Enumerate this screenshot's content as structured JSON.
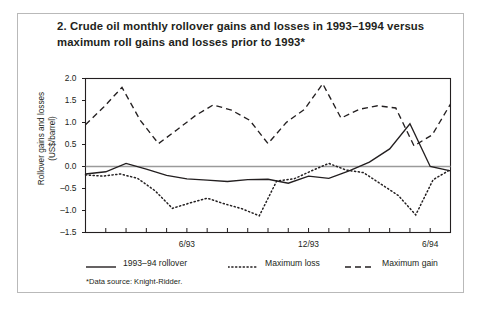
{
  "figure": {
    "title": "2. Crude oil monthly rollover gains and losses in 1993–1994 versus maximum roll gains and losses prior to 1993*",
    "footnote": "*Data source: Knight-Ridder."
  },
  "chart_data": {
    "type": "line",
    "title": "2. Crude oil monthly rollover gains and losses in 1993–1994 versus maximum roll gains and losses prior to 1993*",
    "xlabel": "",
    "ylabel": "Rollover gains and losses (US$/barrel)",
    "ylim": [
      -1.5,
      2.0
    ],
    "ytick_labels": [
      "2.0",
      "1.5",
      "1.0",
      "0.5",
      "0.0",
      "-0.5",
      "-1.0",
      "-1.5"
    ],
    "ytick_values": [
      2.0,
      1.5,
      1.0,
      0.5,
      0.0,
      -0.5,
      -1.0,
      -1.5
    ],
    "xtick_labels": [
      "6/93",
      "12/93",
      "6/94"
    ],
    "xtick_label_positions": [
      5,
      11,
      17
    ],
    "x_index_count": 19,
    "grid": false,
    "zero_line": true,
    "legend_position": "below-axes",
    "series": [
      {
        "name": "1993–94 rollover",
        "style": "solid",
        "color": "#231f20",
        "values": [
          -0.17,
          -0.12,
          0.07,
          -0.06,
          -0.2,
          -0.28,
          -0.31,
          -0.34,
          -0.3,
          -0.29,
          -0.38,
          -0.22,
          -0.27,
          -0.1,
          0.1,
          0.4,
          0.97,
          0.0,
          -0.1
        ]
      },
      {
        "name": "Maximum loss",
        "style": "dotted",
        "color": "#231f20",
        "values": [
          -0.19,
          -0.22,
          -0.17,
          -0.27,
          -0.55,
          -0.95,
          -0.83,
          -0.72,
          -0.85,
          -0.96,
          -1.12,
          -0.33,
          -0.28,
          -0.1,
          0.07,
          -0.08,
          -0.14,
          -0.4,
          -0.66,
          -1.1,
          -0.3,
          -0.07
        ]
      },
      {
        "name": "Maximum gain",
        "style": "dashed",
        "color": "#231f20",
        "values": [
          0.95,
          1.35,
          1.8,
          1.05,
          0.52,
          0.83,
          1.15,
          1.4,
          1.28,
          1.05,
          0.52,
          1.0,
          1.3,
          1.88,
          1.1,
          1.3,
          1.38,
          1.33,
          0.47,
          0.72,
          1.42
        ]
      }
    ]
  },
  "legend": {
    "items": [
      {
        "label": "1993–94 rollover",
        "style": "solid"
      },
      {
        "label": "Maximum loss",
        "style": "dotted"
      },
      {
        "label": "Maximum gain",
        "style": "dashed"
      }
    ]
  },
  "axis": {
    "y_label_line1": "Rollover gains and losses",
    "y_label_line2": "(US$/barrel)"
  }
}
